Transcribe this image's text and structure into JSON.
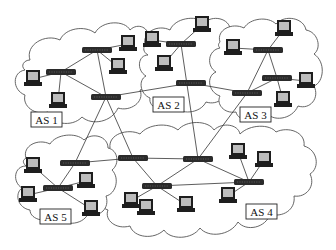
{
  "diagram": {
    "colors": {
      "background": "#ffffff",
      "cloud_stroke": "#555555",
      "link": "#333333",
      "router": "#2b2b2b",
      "computer": "#1e1e1e",
      "screen": "#bdbdbd"
    },
    "autonomous_systems": [
      {
        "id": "as1",
        "label": "AS 1",
        "label_x": 31,
        "label_y": 112
      },
      {
        "id": "as2",
        "label": "AS 2",
        "label_x": 153,
        "label_y": 97
      },
      {
        "id": "as3",
        "label": "AS 3",
        "label_x": 240,
        "label_y": 107
      },
      {
        "id": "as4",
        "label": "AS 4",
        "label_x": 246,
        "label_y": 204
      },
      {
        "id": "as5",
        "label": "AS 5",
        "label_x": 40,
        "label_y": 209
      }
    ],
    "routers": [
      {
        "id": "R1",
        "as": "AS 1",
        "x": 97,
        "y": 50
      },
      {
        "id": "R2",
        "as": "AS 1",
        "x": 61,
        "y": 72
      },
      {
        "id": "R3",
        "as": "AS 1",
        "x": 106,
        "y": 97
      },
      {
        "id": "R4",
        "as": "AS 2",
        "x": 181,
        "y": 44
      },
      {
        "id": "R5",
        "as": "AS 2",
        "x": 191,
        "y": 83
      },
      {
        "id": "R6",
        "as": "AS 3",
        "x": 268,
        "y": 50
      },
      {
        "id": "R7",
        "as": "AS 3",
        "x": 277,
        "y": 78
      },
      {
        "id": "R8",
        "as": "AS 3",
        "x": 247,
        "y": 93
      },
      {
        "id": "R9",
        "as": "AS 5",
        "x": 75,
        "y": 163
      },
      {
        "id": "R10",
        "as": "AS 5",
        "x": 58,
        "y": 188
      },
      {
        "id": "R11",
        "as": "AS 4",
        "x": 133,
        "y": 158
      },
      {
        "id": "R12",
        "as": "AS 4",
        "x": 198,
        "y": 159
      },
      {
        "id": "R13",
        "as": "AS 4",
        "x": 157,
        "y": 186
      },
      {
        "id": "R14",
        "as": "AS 4",
        "x": 249,
        "y": 182
      }
    ],
    "computers": [
      {
        "id": "PC1",
        "as": "AS 1",
        "x": 128,
        "y": 44
      },
      {
        "id": "PC2",
        "as": "AS 1",
        "x": 118,
        "y": 67
      },
      {
        "id": "PC3",
        "as": "AS 1",
        "x": 33,
        "y": 79
      },
      {
        "id": "PC4",
        "as": "AS 1",
        "x": 58,
        "y": 101
      },
      {
        "id": "PC5",
        "as": "AS 2",
        "x": 152,
        "y": 40
      },
      {
        "id": "PC6",
        "as": "AS 2",
        "x": 164,
        "y": 64
      },
      {
        "id": "PC7",
        "as": "AS 2",
        "x": 202,
        "y": 25
      },
      {
        "id": "PC8",
        "as": "AS 3",
        "x": 233,
        "y": 48
      },
      {
        "id": "PC9",
        "as": "AS 3",
        "x": 284,
        "y": 29
      },
      {
        "id": "PC10",
        "as": "AS 3",
        "x": 306,
        "y": 81
      },
      {
        "id": "PC11",
        "as": "AS 3",
        "x": 283,
        "y": 100
      },
      {
        "id": "PC12",
        "as": "AS 5",
        "x": 33,
        "y": 166
      },
      {
        "id": "PC13",
        "as": "AS 5",
        "x": 28,
        "y": 195
      },
      {
        "id": "PC14",
        "as": "AS 5",
        "x": 86,
        "y": 181
      },
      {
        "id": "PC15",
        "as": "AS 5",
        "x": 91,
        "y": 209
      },
      {
        "id": "PC16",
        "as": "AS 4",
        "x": 146,
        "y": 208
      },
      {
        "id": "PC17",
        "as": "AS 4",
        "x": 186,
        "y": 205
      },
      {
        "id": "PC18",
        "as": "AS 4",
        "x": 238,
        "y": 152
      },
      {
        "id": "PC19",
        "as": "AS 4",
        "x": 264,
        "y": 160
      },
      {
        "id": "PC20",
        "as": "AS 4",
        "x": 228,
        "y": 196
      },
      {
        "id": "PC21",
        "as": "AS 4",
        "x": 131,
        "y": 201
      }
    ],
    "links": [
      [
        "R1",
        "R2"
      ],
      [
        "R1",
        "PC1"
      ],
      [
        "R1",
        "PC2"
      ],
      [
        "R1",
        "R3"
      ],
      [
        "R2",
        "PC3"
      ],
      [
        "R2",
        "PC4"
      ],
      [
        "R2",
        "R3"
      ],
      [
        "R3",
        "R5"
      ],
      [
        "R3",
        "R9"
      ],
      [
        "R3",
        "R11"
      ],
      [
        "R4",
        "PC5"
      ],
      [
        "R4",
        "PC7"
      ],
      [
        "R4",
        "PC6"
      ],
      [
        "R4",
        "R12"
      ],
      [
        "R5",
        "R8"
      ],
      [
        "R6",
        "PC8"
      ],
      [
        "R6",
        "PC9"
      ],
      [
        "R6",
        "R8"
      ],
      [
        "R6",
        "R7"
      ],
      [
        "R7",
        "PC10"
      ],
      [
        "R7",
        "PC11"
      ],
      [
        "R7",
        "R8"
      ],
      [
        "R8",
        "R12"
      ],
      [
        "R9",
        "R10"
      ],
      [
        "R9",
        "R11"
      ],
      [
        "R10",
        "PC12"
      ],
      [
        "R10",
        "PC13"
      ],
      [
        "R10",
        "PC14"
      ],
      [
        "R10",
        "PC15"
      ],
      [
        "R11",
        "R12"
      ],
      [
        "R11",
        "R13"
      ],
      [
        "R12",
        "R13"
      ],
      [
        "R12",
        "R14"
      ],
      [
        "R13",
        "R14"
      ],
      [
        "R13",
        "PC21"
      ],
      [
        "R13",
        "PC17"
      ],
      [
        "R14",
        "PC18"
      ],
      [
        "R14",
        "PC19"
      ],
      [
        "R14",
        "PC20"
      ]
    ]
  }
}
